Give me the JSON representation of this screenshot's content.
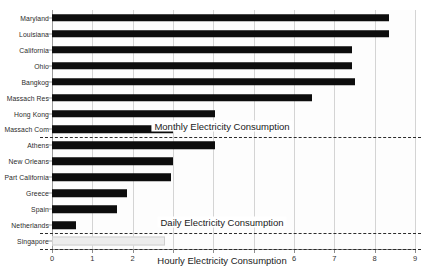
{
  "chart_data": {
    "type": "bar",
    "orientation": "horizontal",
    "title": "",
    "xlabel": "",
    "ylabel": "",
    "xlim": [
      0,
      9
    ],
    "xticks": [
      "0",
      "1",
      "2",
      "3",
      "4",
      "5",
      "6",
      "7",
      "8",
      "9"
    ],
    "grid": true,
    "legend": "none",
    "categories": [
      "Maryland",
      "Louisiana",
      "California",
      "Ohio",
      "Bangkog",
      "Massach Res",
      "Hong Kong",
      "Massach Com",
      "Athens",
      "New Orleans",
      "Part California",
      "Greece",
      "Spain",
      "Netherlands",
      "Singapore"
    ],
    "values": [
      8.35,
      8.35,
      7.45,
      7.45,
      7.5,
      6.45,
      4.05,
      3.0,
      4.05,
      3.0,
      2.95,
      1.85,
      1.6,
      0.6,
      2.8
    ],
    "bar_colors": [
      "#0d0d0d",
      "#0d0d0d",
      "#0d0d0d",
      "#0d0d0d",
      "#0d0d0d",
      "#0d0d0d",
      "#0d0d0d",
      "#0d0d0d",
      "#0d0d0d",
      "#0d0d0d",
      "#0d0d0d",
      "#0d0d0d",
      "#0d0d0d",
      "#0d0d0d",
      "#ededed"
    ],
    "annotations": [
      {
        "text": "Monthly Electricity Consumption",
        "group_end_category": "Massach Com"
      },
      {
        "text": "Daily Electricity Consumption",
        "group_end_category": "Netherlands"
      },
      {
        "text": "Hourly Electricity Consumption",
        "group_end_category": "Singapore"
      }
    ],
    "separator_color": "#2b2b2b",
    "grid_color": "#d4d4d4",
    "axis_color": "#8d8d8d"
  }
}
